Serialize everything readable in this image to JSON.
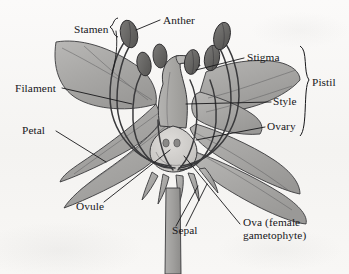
{
  "diagram": {
    "background_color": "#f6f5f3",
    "ink_color": "#17171a",
    "petal_fill": "#a8a7a5",
    "anther_fill": "#6f6e6c",
    "ovary_fill": "#c9c8c5"
  },
  "labels": {
    "stamen": {
      "text": "Stamen",
      "x": 74,
      "y": 23
    },
    "anther": {
      "text": "Anther",
      "x": 163,
      "y": 14
    },
    "stigma": {
      "text": "Stigma",
      "x": 247,
      "y": 55
    },
    "style": {
      "text": "Style",
      "x": 273,
      "y": 99
    },
    "ovary": {
      "text": "Ovary",
      "x": 267,
      "y": 123
    },
    "pistil": {
      "text": "Pistil",
      "x": 312,
      "y": 83
    },
    "filament": {
      "text": "Filament",
      "x": 15,
      "y": 84
    },
    "petal": {
      "text": "Petal",
      "x": 22,
      "y": 126
    },
    "ovule": {
      "text": "Ovule",
      "x": 76,
      "y": 207
    },
    "sepal": {
      "text": "Sepal",
      "x": 172,
      "y": 231
    },
    "ova": {
      "text": "Ova (female\ngametophyte)",
      "x": 243,
      "y": 222
    }
  },
  "parts": [
    {
      "name": "stamen",
      "description": "male reproductive organ comprising anther and filament"
    },
    {
      "name": "anther",
      "description": "pollen-bearing sac at filament tip",
      "count": 6
    },
    {
      "name": "filament",
      "description": "slender stalk supporting the anther"
    },
    {
      "name": "pistil",
      "description": "female reproductive organ comprising stigma, style and ovary"
    },
    {
      "name": "stigma",
      "description": "receptive pollen-catching tip of pistil"
    },
    {
      "name": "style",
      "description": "column connecting stigma to ovary"
    },
    {
      "name": "ovary",
      "description": "swollen base of pistil enclosing ovules"
    },
    {
      "name": "ovule",
      "description": "structure within ovary that becomes a seed"
    },
    {
      "name": "ova",
      "description": "female gametophyte inside the ovule",
      "count": 2
    },
    {
      "name": "petal",
      "description": "showy perianth segment",
      "count": 5
    },
    {
      "name": "sepal",
      "description": "outer protective perianth segment",
      "count": 5
    }
  ]
}
